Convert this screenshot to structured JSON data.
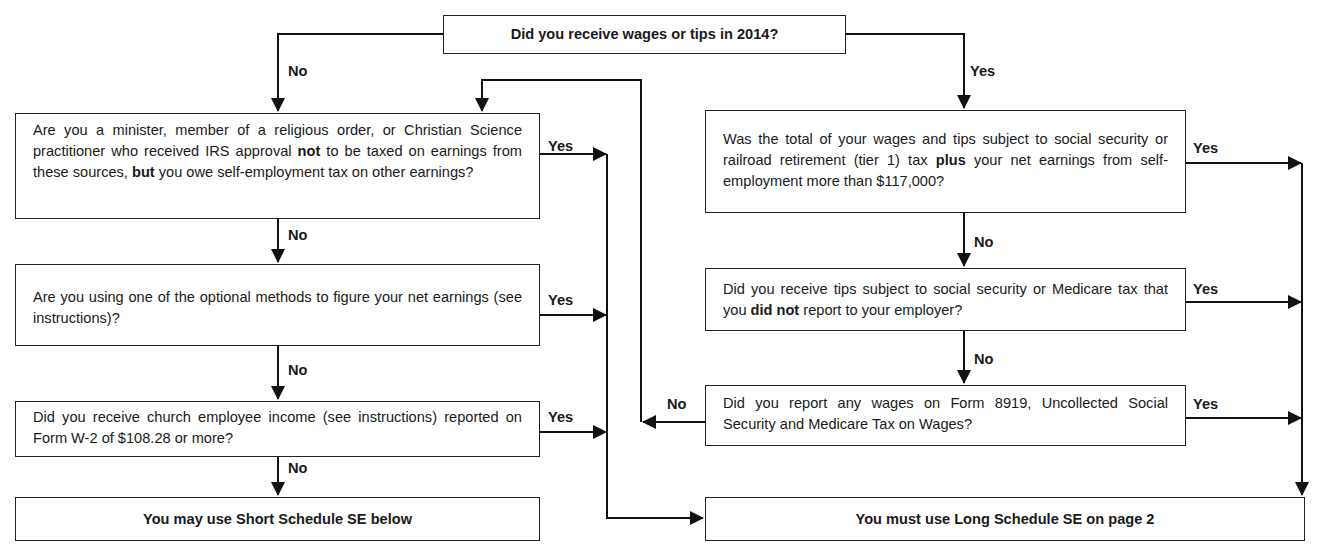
{
  "diagram": {
    "type": "flowchart",
    "start": {
      "id": "q_wages",
      "text": "Did you receive wages or tips in 2014?"
    },
    "left_column": [
      {
        "id": "q_minister",
        "text_parts": [
          "Are you a minister, member of a religious order, or Christian Science practitioner who received IRS approval ",
          "not",
          " to be taxed on earnings from these sources, ",
          "but",
          " you owe self-employment tax on other earnings?"
        ],
        "yes_label": "Yes",
        "no_label": "No"
      },
      {
        "id": "q_optional",
        "text": "Are you using one of the optional methods to figure your net earnings (see instructions)?",
        "yes_label": "Yes",
        "no_label": "No"
      },
      {
        "id": "q_church",
        "text": "Did you receive church employee income (see instructions) reported on Form  W-2 of $108.28 or more?",
        "yes_label": "Yes",
        "no_label": "No"
      }
    ],
    "right_column": [
      {
        "id": "q_total",
        "text_parts": [
          "Was the total of your wages and tips subject to social security or railroad retirement (tier 1) tax ",
          "plus",
          " your net earnings from self-employment more than $117,000?"
        ],
        "yes_label": "Yes",
        "no_label": "No"
      },
      {
        "id": "q_tips",
        "text_parts": [
          "Did you receive tips subject to social security or Medicare tax that you ",
          "did not",
          " report to your employer?"
        ],
        "yes_label": "Yes",
        "no_label": "No"
      },
      {
        "id": "q_8919",
        "text": "Did you report any wages on Form 8919, Uncollected Social Security and Medicare Tax on Wages?",
        "yes_label": "Yes",
        "no_label": "No"
      }
    ],
    "outcomes": {
      "short": "You may use Short Schedule SE below",
      "long": "You must use Long Schedule SE on page 2"
    },
    "edge_labels": {
      "start_no": "No",
      "start_yes": "Yes"
    }
  }
}
